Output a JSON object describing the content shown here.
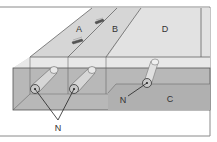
{
  "diagram": {
    "labels": {
      "a": "A",
      "b": "B",
      "c": "C",
      "d": "D",
      "n_left": "N",
      "n_right": "N"
    },
    "colors": {
      "background": "#ffffff",
      "top_face": "#d9d9d9",
      "top_face_d": "#e3e3e3",
      "edge_strip": "#e6e6e6",
      "front_face": "#b5b5b5",
      "front_lower": "#b0b0b0",
      "line": "#555555",
      "frame": "#8a8a8a",
      "dowel_fill": "#e8e8e8"
    }
  }
}
